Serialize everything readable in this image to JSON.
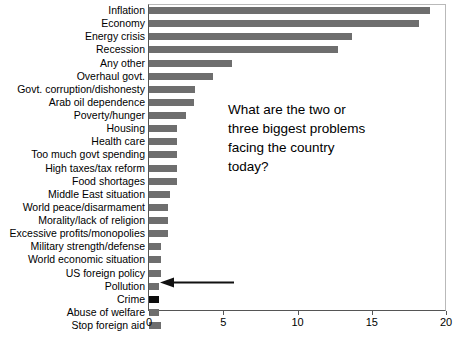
{
  "chart_data": {
    "type": "bar",
    "orientation": "horizontal",
    "title": "",
    "xlabel": "",
    "ylabel": "",
    "xlim": [
      0,
      20
    ],
    "xticks": [
      0,
      5,
      10,
      15,
      20
    ],
    "xtick_labels": [
      "0",
      "5",
      "10",
      "15",
      "20"
    ],
    "grid": false,
    "legend": null,
    "bar_color": "#6e6e6e",
    "highlight_color": "#0d0d0d",
    "categories": [
      "Inflation",
      "Economy",
      "Energy crisis",
      "Recession",
      "Any other",
      "Overhaul govt.",
      "Govt. corruption/dishonesty",
      "Arab oil dependence",
      "Poverty/hunger",
      "Housing",
      "Health care",
      "Too much govt spending",
      "High taxes/tax reform",
      "Food shortages",
      "Middle East situation",
      "World peace/disarmament",
      "Morality/lack of religion",
      "Excessive profits/monopolies",
      "Military strength/defense",
      "World economic situation",
      "US foreign policy",
      "Pollution",
      "Crime",
      "Abuse of welfare",
      "Stop foreign aid"
    ],
    "values": [
      18.9,
      18.2,
      13.7,
      12.7,
      5.6,
      4.3,
      3.1,
      3.0,
      2.5,
      1.9,
      1.9,
      1.9,
      1.9,
      1.9,
      1.4,
      1.3,
      1.3,
      1.3,
      0.8,
      0.8,
      0.8,
      0.7,
      0.7,
      0.7,
      0.8
    ],
    "highlighted_category": "Crime",
    "annotations": [
      {
        "name": "question-annotation",
        "text": "What are the two or three biggest problems facing the country today?"
      },
      {
        "name": "crime-arrow-annotation",
        "points_to": "Crime",
        "direction": "left"
      }
    ]
  },
  "annotation": {
    "line1": "What are the two or",
    "line2": "three biggest problems",
    "line3": "facing the country",
    "line4": "today?"
  }
}
